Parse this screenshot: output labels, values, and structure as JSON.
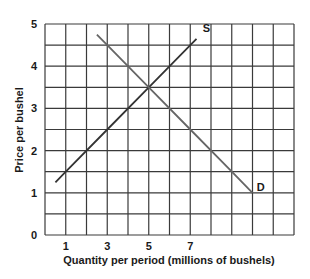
{
  "chart_data": {
    "type": "line",
    "title": "",
    "xlabel": "Quantity per period (millions of bushels)",
    "ylabel": "Price per bushel",
    "xlim": [
      0,
      12
    ],
    "ylim": [
      0,
      5
    ],
    "x_ticks": [
      1,
      3,
      5,
      7
    ],
    "y_ticks": [
      0,
      1,
      2,
      3,
      4,
      5
    ],
    "grid": true,
    "grid_x_step": 1,
    "grid_y_step": 0.5,
    "legend": "none",
    "series": [
      {
        "name": "S",
        "label": "S",
        "points": [
          [
            0.5,
            1.25
          ],
          [
            1,
            1.5
          ],
          [
            3,
            2.5
          ],
          [
            5,
            3.5
          ],
          [
            7,
            4.5
          ],
          [
            7.3,
            4.65
          ]
        ],
        "color": "#333333"
      },
      {
        "name": "D",
        "label": "D",
        "points": [
          [
            2.5,
            4.75
          ],
          [
            3,
            4.5
          ],
          [
            5,
            3.5
          ],
          [
            7,
            2.5
          ],
          [
            9,
            1.5
          ],
          [
            10,
            1.0
          ]
        ],
        "color": "#666666"
      }
    ],
    "annotations": [
      {
        "text": "S",
        "x": 7.6,
        "y": 4.8
      },
      {
        "text": "D",
        "x": 10.2,
        "y": 1.05
      }
    ],
    "equilibrium": {
      "x": 5,
      "y": 3.5
    }
  },
  "colors": {
    "grid": "#3a3a3a",
    "axis_text": "#1a1a1a",
    "background": "#ffffff"
  }
}
